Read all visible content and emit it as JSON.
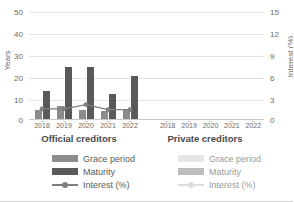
{
  "chart_data": {
    "type": "bar",
    "title": "",
    "subtitle": "",
    "ylabel": "Years",
    "y2label": "Interest (%)",
    "xlabel": "",
    "ylim": [
      0,
      50
    ],
    "y2lim": [
      0,
      15
    ],
    "yticks": [
      "0",
      "10",
      "20",
      "30",
      "40",
      "50"
    ],
    "y2ticks": [
      "0",
      "3",
      "6",
      "9",
      "12",
      "15"
    ],
    "grid": "horizontal",
    "legend_position": "bottom",
    "panels": [
      {
        "id": "official",
        "caption": "Official creditors",
        "categories": [
          "2018",
          "2019",
          "2020",
          "2021",
          "2022"
        ],
        "series": [
          {
            "name": "Grace period",
            "axis": "left",
            "type": "bar",
            "color": "#8c8c8c",
            "values": [
              4.0,
              5.8,
              4.2,
              3.6,
              4.2
            ]
          },
          {
            "name": "Maturity",
            "axis": "left",
            "type": "bar",
            "color": "#595959",
            "values": [
              13.0,
              24.0,
              24.2,
              11.5,
              20.0
            ]
          },
          {
            "name": "Interest (%)",
            "axis": "right",
            "type": "line",
            "color": "#7f7f7f",
            "values": [
              1.4,
              1.4,
              2.0,
              1.3,
              1.3
            ]
          }
        ]
      },
      {
        "id": "private",
        "caption": "Private creditors",
        "categories": [
          "2018",
          "2019",
          "2020",
          "2021",
          "2022"
        ],
        "series": [
          {
            "name": "Grace period",
            "axis": "left",
            "type": "bar",
            "color": "#e4e4e4",
            "values": [
              null,
              null,
              null,
              null,
              null
            ]
          },
          {
            "name": "Maturity",
            "axis": "left",
            "type": "bar",
            "color": "#bdbdbd",
            "values": [
              null,
              null,
              null,
              null,
              null
            ]
          },
          {
            "name": "Interest (%)",
            "axis": "right",
            "type": "line",
            "color": "#d8d8d8",
            "values": [
              null,
              null,
              null,
              null,
              null
            ]
          }
        ]
      }
    ]
  },
  "legends": {
    "official": [
      {
        "label": "Grace period",
        "marker": "swatch",
        "color": "#8c8c8c"
      },
      {
        "label": "Maturity",
        "marker": "swatch",
        "color": "#595959"
      },
      {
        "label": "Interest (%)",
        "marker": "line",
        "color": "#7f7f7f"
      }
    ],
    "private": [
      {
        "label": "Grace period",
        "marker": "swatch",
        "color": "#e6e6e6"
      },
      {
        "label": "Maturity",
        "marker": "swatch",
        "color": "#bdbdbd"
      },
      {
        "label": "Interest (%)",
        "marker": "line",
        "color": "#dcdcdc"
      }
    ]
  },
  "colors": {
    "grid": "#e3e3e3",
    "axis": "#c9c9c9",
    "text": "#6b6b6b",
    "caption": "#4a4a4a"
  }
}
